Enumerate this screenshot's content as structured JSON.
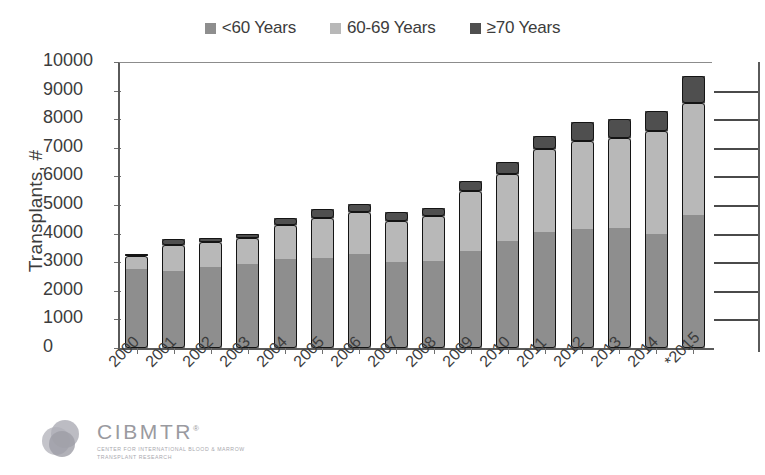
{
  "chart_data": {
    "type": "bar",
    "stacked": true,
    "title": "",
    "subtitle": "",
    "xlabel": "",
    "ylabel": "Transplants, #",
    "ylim": [
      0,
      10000
    ],
    "ytick_step": 1000,
    "yticks": [
      "10000",
      "9000",
      "8000",
      "7000",
      "6000",
      "5000",
      "4000",
      "3000",
      "2000",
      "1000",
      "0"
    ],
    "grid": false,
    "legend_position": "top-center",
    "categories": [
      "2000",
      "2001",
      "2002",
      "2003",
      "2004",
      "2005",
      "2006",
      "2007",
      "2008",
      "2009",
      "2010",
      "2011",
      "2012",
      "2013",
      "2014",
      "*2015"
    ],
    "series": [
      {
        "name": "<60 Years",
        "color": "#8e8e8e",
        "values": [
          2780,
          2700,
          2850,
          2950,
          3100,
          3150,
          3300,
          3000,
          3050,
          3400,
          3750,
          4050,
          4150,
          4200,
          4000,
          4650
        ]
      },
      {
        "name": "60-69 Years",
        "color": "#b8b8b8",
        "values": [
          420,
          900,
          850,
          900,
          1200,
          1400,
          1450,
          1450,
          1550,
          2100,
          2350,
          2900,
          3100,
          3150,
          3600,
          3900
        ]
      },
      {
        "name": "≥70 Years",
        "color": "#4f4f4f",
        "values": [
          100,
          200,
          150,
          150,
          250,
          300,
          300,
          300,
          300,
          350,
          400,
          450,
          650,
          650,
          700,
          950
        ]
      }
    ],
    "totals": [
      3300,
      3800,
      3850,
      4000,
      4550,
      4850,
      5050,
      4750,
      4900,
      5850,
      6500,
      7400,
      7900,
      8000,
      8300,
      9500
    ],
    "annotations": [
      "*2015 data are preliminary"
    ]
  },
  "legend": {
    "items": [
      {
        "label": "<60 Years",
        "swatch": "#8e8e8e",
        "icon": "square-swatch-icon"
      },
      {
        "label": "60-69 Years",
        "swatch": "#b8b8b8",
        "icon": "square-swatch-icon"
      },
      {
        "label": "≥70 Years",
        "swatch": "#4f4f4f",
        "icon": "square-swatch-icon"
      }
    ]
  },
  "logo": {
    "wordmark": "CIBMTR",
    "trademark": "®",
    "tagline": "CENTER FOR INTERNATIONAL BLOOD & MARROW TRANSPLANT RESEARCH"
  },
  "colors": {
    "bar_lt60": "#8e8e8e",
    "bar_6069": "#b8b8b8",
    "bar_70plus": "#4f4f4f",
    "bar_outline": "#141414",
    "axis": "#5a5a5a",
    "text": "#3c3c3c",
    "background": "#ffffff"
  }
}
